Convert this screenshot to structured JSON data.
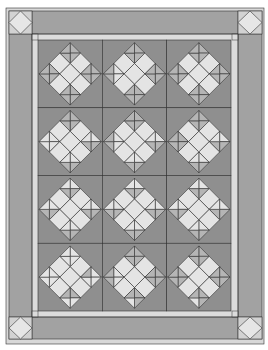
{
  "colors": {
    "background": "#ffffff",
    "outer_binding": "#d8d8d8",
    "border_band": "#a2a2a2",
    "inner_strip": "#dcdcdc",
    "block_background": "#8f8f8f",
    "light_square": "#e4e4e4",
    "hourglass_triangle": "#b5b5b5",
    "cornerstone": "#d2d2d2",
    "cornerstone_diamond": "#e6e6e6",
    "line": "#333333"
  },
  "layout": {
    "outer": {
      "x": 6,
      "y": 8,
      "w": 258,
      "h": 336
    },
    "band": {
      "x": 9,
      "y": 11,
      "w": 253,
      "h": 328
    },
    "inner_strip": {
      "x": 32,
      "y": 34,
      "w": 206,
      "h": 283
    },
    "blocks_area": {
      "x": 38,
      "y": 40,
      "w": 193,
      "h": 271
    },
    "cornerstones": [
      {
        "name": "top-left",
        "x": 9,
        "y": 11,
        "w": 23,
        "h": 23
      },
      {
        "name": "top-right",
        "x": 238,
        "y": 11,
        "w": 24,
        "h": 23
      },
      {
        "name": "bottom-left",
        "x": 9,
        "y": 317,
        "w": 23,
        "h": 22
      },
      {
        "name": "bottom-right",
        "x": 238,
        "y": 317,
        "w": 24,
        "h": 22
      }
    ]
  },
  "grid": {
    "columns": 3,
    "rows": 4,
    "block_count": 12
  },
  "block_design": {
    "name": "on-point nine-patch star",
    "light_squares": [
      "center",
      "top",
      "bottom",
      "left",
      "right"
    ],
    "hourglass_cells": [
      "top-left",
      "top-right",
      "bottom-left",
      "bottom-right"
    ]
  }
}
